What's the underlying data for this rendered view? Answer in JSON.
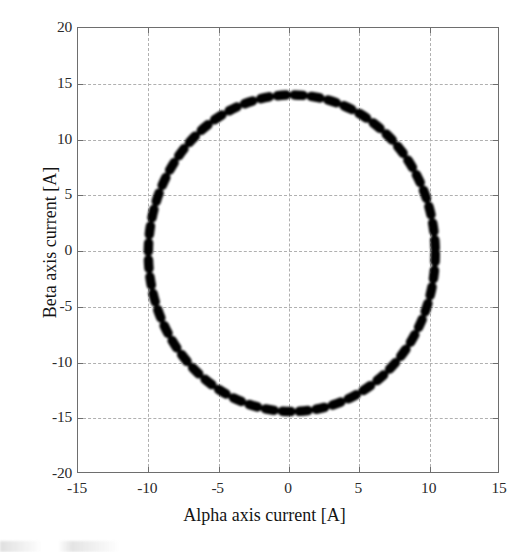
{
  "figure": {
    "background": "#ffffff",
    "frame_color": "#6e6e6e",
    "grid_color": "#b0b0b0",
    "marker_color": "#000000"
  },
  "axis": {
    "x_title": "Alpha axis current [A]",
    "y_title": "Beta axis current [A]",
    "x_ticks": [
      "-15",
      "-10",
      "-5",
      "0",
      "5",
      "10",
      "15"
    ],
    "y_ticks": [
      "20",
      "15",
      "10",
      "5",
      "0",
      "-5",
      "-10",
      "-15",
      "-20"
    ]
  },
  "chart_data": {
    "type": "scatter",
    "title": "",
    "subtitle": "",
    "xlabel": "Alpha axis current [A]",
    "ylabel": "Beta axis current [A]",
    "xlim": [
      -15,
      15
    ],
    "ylim": [
      -20,
      20
    ],
    "xticks": [
      -15,
      -10,
      -5,
      0,
      5,
      10,
      15
    ],
    "yticks": [
      -20,
      -15,
      -10,
      -5,
      0,
      5,
      10,
      15,
      20
    ],
    "grid": true,
    "legend": false,
    "legend_position": "none",
    "annotations": [],
    "series": [
      {
        "name": "Stator current locus (alpha-beta)",
        "style": "thick black dashed circular trajectory",
        "marker": "dash",
        "marker_color": "#000000",
        "shape": "circle",
        "center": [
          0.2,
          -0.2
        ],
        "radius_alpha": 10.2,
        "radius_beta": 14.2,
        "n_points": 56,
        "x": [
          10.4,
          10.3,
          10.1,
          9.7,
          9.2,
          8.6,
          7.8,
          6.9,
          5.9,
          4.9,
          3.7,
          2.5,
          1.3,
          0.1,
          -1.1,
          -2.3,
          -3.5,
          -4.7,
          -5.7,
          -6.7,
          -7.6,
          -8.4,
          -9.0,
          -9.5,
          -9.8,
          -10.0,
          -10.0,
          -9.8,
          -9.5,
          -9.0,
          -8.4,
          -7.6,
          -6.7,
          -5.7,
          -4.7,
          -3.5,
          -2.3,
          -1.1,
          0.1,
          1.3,
          2.5,
          3.7,
          4.9,
          5.9,
          6.9,
          7.8,
          8.6,
          9.2,
          9.7,
          10.1,
          10.3,
          10.4,
          10.4,
          10.3,
          10.1,
          9.7
        ],
        "y": [
          -0.2,
          1.4,
          3.0,
          4.6,
          6.1,
          7.6,
          9.0,
          10.2,
          11.3,
          12.2,
          13.0,
          13.6,
          13.9,
          14.0,
          13.9,
          13.6,
          13.0,
          12.2,
          11.3,
          10.2,
          9.0,
          7.6,
          6.1,
          4.6,
          3.0,
          1.4,
          -0.2,
          -1.8,
          -3.4,
          -5.0,
          -6.5,
          -8.0,
          -9.4,
          -10.6,
          -11.7,
          -12.6,
          -13.3,
          -13.9,
          -14.3,
          -14.3,
          -13.9,
          -13.3,
          -12.6,
          -11.7,
          -10.6,
          -9.4,
          -8.0,
          -6.5,
          -5.0,
          -3.4,
          -1.8,
          -0.2,
          -0.2,
          1.4,
          3.0,
          4.6
        ]
      }
    ]
  }
}
